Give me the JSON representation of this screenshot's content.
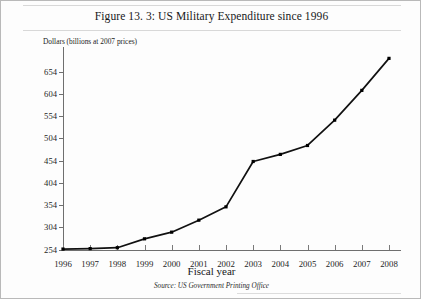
{
  "figure": {
    "title": "Figure 13. 3: US Military Expenditure since 1996",
    "source": "Source: US Government Printing Office"
  },
  "chart_data": {
    "type": "line",
    "title": "Figure 13. 3: US Military Expenditure since 1996",
    "xlabel": "Fiscal year",
    "ylabel": "Dollars (billions at 2007 prices)",
    "categories": [
      1996,
      1997,
      1998,
      1999,
      2000,
      2001,
      2002,
      2003,
      2004,
      2005,
      2006,
      2007,
      2008
    ],
    "values": [
      255,
      256,
      258,
      278,
      293,
      320,
      350,
      452,
      468,
      488,
      545,
      612,
      684
    ],
    "x": [
      1996,
      1997,
      1998,
      1999,
      2000,
      2001,
      2002,
      2003,
      2004,
      2005,
      2006,
      2007,
      2008
    ],
    "xtick_labels": [
      "1996",
      "1997",
      "1998",
      "1999",
      "2000",
      "2001",
      "2002",
      "2003",
      "2004",
      "2005",
      "2006",
      "2007",
      "2008"
    ],
    "ytick_labels": [
      "254",
      "304",
      "354",
      "404",
      "454",
      "504",
      "554",
      "604",
      "654"
    ],
    "yticks": [
      254,
      304,
      354,
      404,
      454,
      504,
      554,
      604,
      654
    ],
    "ylim": [
      254,
      700
    ],
    "xlim": [
      1996,
      2008
    ],
    "grid": false,
    "legend": false,
    "marker": "square",
    "line_color": "#111111",
    "annotations": [
      "Source: US Government Printing Office"
    ]
  }
}
